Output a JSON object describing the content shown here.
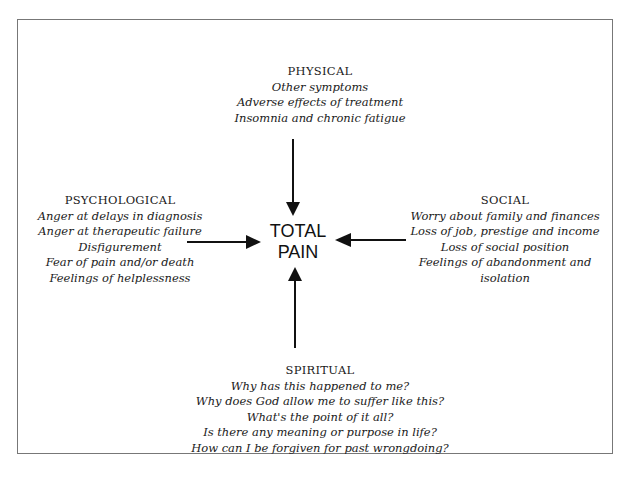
{
  "diagram": {
    "center": {
      "line1": "TOTAL",
      "line2": "PAIN"
    },
    "physical": {
      "title": "PHYSICAL",
      "items": [
        "Other symptoms",
        "Adverse effects of treatment",
        "Insomnia and chronic fatigue"
      ]
    },
    "psychological": {
      "title": "PSYCHOLOGICAL",
      "items": [
        "Anger at delays in diagnosis",
        "Anger at therapeutic failure",
        "Disfigurement",
        "Fear of pain and/or death",
        "Feelings of helplessness"
      ]
    },
    "social": {
      "title": "SOCIAL",
      "items": [
        "Worry about family and finances",
        "Loss of job, prestige and income",
        "Loss of social position",
        "Feelings of abandonment and",
        "isolation"
      ]
    },
    "spiritual": {
      "title": "SPIRITUAL",
      "items": [
        "Why has this happened to me?",
        "Why does God allow me to suffer like this?",
        "What's the point of it all?",
        "Is there any meaning or purpose in life?",
        "How can I be forgiven for past wrongdoing?"
      ]
    }
  }
}
